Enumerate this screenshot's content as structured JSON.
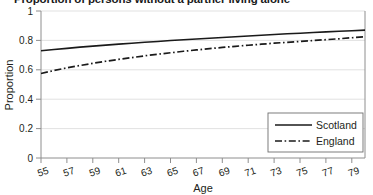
{
  "figure": {
    "title_cropped": "Proportion of persons without a partner living alone",
    "y_axis_title": "Proportion",
    "x_axis_title": "Age"
  },
  "chart_data": {
    "type": "line",
    "title": "Proportion of persons without a partner living alone",
    "xlabel": "Age",
    "ylabel": "Proportion",
    "xlim": [
      55,
      80
    ],
    "ylim": [
      0,
      1
    ],
    "grid": true,
    "legend_position": "bottom-right",
    "x_ticks": [
      "55",
      "57",
      "59",
      "61",
      "63",
      "65",
      "67",
      "69",
      "71",
      "73",
      "75",
      "77",
      "79"
    ],
    "y_ticks": [
      "0",
      "0.2",
      "0.4",
      "0.6",
      "0.8",
      "1"
    ],
    "x": [
      55,
      56,
      57,
      58,
      59,
      60,
      61,
      62,
      63,
      64,
      65,
      66,
      67,
      68,
      69,
      70,
      71,
      72,
      73,
      74,
      75,
      76,
      77,
      78,
      79,
      80
    ],
    "series": [
      {
        "name": "Scotland",
        "style": "solid",
        "color": "#1a1a1a",
        "values": [
          0.73,
          0.738,
          0.746,
          0.754,
          0.761,
          0.768,
          0.775,
          0.781,
          0.787,
          0.793,
          0.799,
          0.804,
          0.81,
          0.815,
          0.82,
          0.825,
          0.83,
          0.835,
          0.84,
          0.845,
          0.849,
          0.854,
          0.858,
          0.862,
          0.866,
          0.87
        ]
      },
      {
        "name": "England",
        "style": "dash-dot",
        "color": "#1a1a1a",
        "values": [
          0.575,
          0.595,
          0.613,
          0.629,
          0.644,
          0.658,
          0.671,
          0.683,
          0.695,
          0.706,
          0.716,
          0.726,
          0.735,
          0.744,
          0.752,
          0.76,
          0.767,
          0.774,
          0.781,
          0.787,
          0.793,
          0.799,
          0.805,
          0.811,
          0.818,
          0.825
        ]
      }
    ],
    "legend": [
      {
        "label": "Scotland",
        "style": "solid"
      },
      {
        "label": "England",
        "style": "dash-dot"
      }
    ]
  }
}
